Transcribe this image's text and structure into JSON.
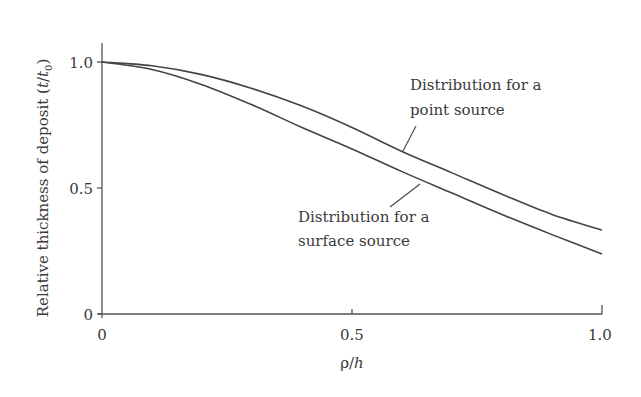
{
  "chart_data": {
    "type": "line",
    "title": "",
    "xlabel": "ρ/h",
    "ylabel": "Relative thickness of deposit (t/t0)",
    "xlim": [
      0,
      1.0
    ],
    "ylim": [
      0,
      1.08
    ],
    "x_ticks": [
      "0",
      "0.5",
      "1.0"
    ],
    "y_ticks": [
      "0",
      "0.5",
      "1.0"
    ],
    "grid": false,
    "legend": "none (inline annotations)",
    "x": [
      0,
      0.1,
      0.2,
      0.3,
      0.4,
      0.5,
      0.6,
      0.7,
      0.8,
      0.9,
      1.0
    ],
    "series": [
      {
        "name": "Distribution for a point source",
        "values": [
          1.0,
          0.985,
          0.95,
          0.895,
          0.825,
          0.74,
          0.645,
          0.56,
          0.475,
          0.395,
          0.333
        ]
      },
      {
        "name": "Distribution for a surface source",
        "values": [
          1.0,
          0.97,
          0.91,
          0.83,
          0.74,
          0.655,
          0.565,
          0.48,
          0.395,
          0.315,
          0.238
        ]
      }
    ],
    "annotations": [
      {
        "text_line1": "Distribution for a",
        "text_line2": "point source",
        "target": "point source curve"
      },
      {
        "text_line1": "Distribution for a",
        "text_line2": "surface source",
        "target": "surface source curve"
      }
    ]
  },
  "axes": {
    "x_label_main": "ρ/",
    "x_label_italic": "h",
    "y_label_prefix": "Relative thickness of deposit (",
    "y_label_t": "t",
    "y_label_slash": "/",
    "y_label_t0": "t",
    "y_label_sub": "0",
    "y_label_suffix": ")",
    "x_tick_labels": [
      "0",
      "0.5",
      "1.0"
    ],
    "y_tick_labels": [
      "0",
      "0.5",
      "1.0"
    ]
  },
  "annotations": {
    "point": {
      "line1": "Distribution for a",
      "line2": "point source"
    },
    "surface": {
      "line1": "Distribution for a",
      "line2": "surface source"
    }
  }
}
